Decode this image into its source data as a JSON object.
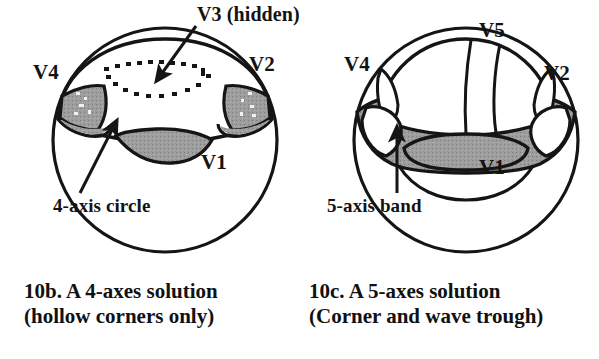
{
  "figure": {
    "background_color": "#ffffff",
    "ink_color": "#151515",
    "shaded_region_color": "#9a9a9a",
    "panels": [
      {
        "id": "panel-10b",
        "sphere": {
          "cx": 165,
          "cy": 140,
          "r": 112
        },
        "vertex_labels": [
          {
            "name": "V4",
            "text": "V4",
            "x": 33,
            "y": 62
          },
          {
            "name": "V3",
            "text": "V3 (hidden)",
            "x": 197,
            "y": 4
          },
          {
            "name": "V2",
            "text": "V2",
            "x": 249,
            "y": 54
          },
          {
            "name": "V1",
            "text": "V1",
            "x": 201,
            "y": 152
          }
        ],
        "annotation": {
          "text": "4-axis circle",
          "x": 53,
          "y": 196
        },
        "caption_lines": [
          "10b. A 4-axes solution",
          "(hollow corners only)"
        ],
        "caption_x": 24,
        "caption_y": 279
      },
      {
        "id": "panel-10c",
        "sphere": {
          "cx": 466,
          "cy": 140,
          "r": 112
        },
        "vertex_labels": [
          {
            "name": "V4",
            "text": "V4",
            "x": 344,
            "y": 54
          },
          {
            "name": "V5",
            "text": "V5",
            "x": 479,
            "y": 20
          },
          {
            "name": "V2",
            "text": "V2",
            "x": 544,
            "y": 63
          },
          {
            "name": "V1",
            "text": "V1",
            "x": 479,
            "y": 157
          }
        ],
        "annotation": {
          "text": "5-axis band",
          "x": 327,
          "y": 196
        },
        "caption_lines": [
          "10c. A 5-axes solution",
          "(Corner and wave trough)"
        ],
        "caption_x": 309,
        "caption_y": 279
      }
    ]
  }
}
